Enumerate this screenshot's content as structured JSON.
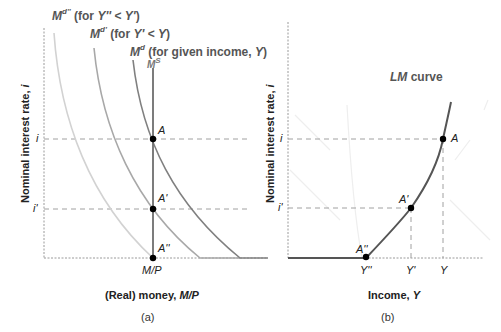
{
  "diagram": {
    "panels": [
      {
        "id": "a",
        "caption": "(a)",
        "x_axis_title": "(Real) money, ",
        "x_axis_title_var": "M/P",
        "y_axis_title": "Nominal interest rate, ",
        "y_axis_title_var": "i",
        "x_tick": "M/P",
        "y_ticks": [
          "i",
          "i'"
        ],
        "curves": [
          {
            "name": "Md''",
            "symbol": "M",
            "sup": "d''",
            "label": " (for ",
            "var1": "Y''",
            "rel": " < ",
            "var2": "Y'",
            "close": ")",
            "color": "#cfcfcf"
          },
          {
            "name": "Md'",
            "symbol": "M",
            "sup": "d'",
            "label": " (for ",
            "var1": "Y'",
            "rel": " < ",
            "var2": "Y",
            "close": ")",
            "color": "#a6a6a6"
          },
          {
            "name": "Md",
            "symbol": "M",
            "sup": "d",
            "label": " (for given income, ",
            "var1": "Y",
            "close": ")",
            "color": "#808080"
          },
          {
            "name": "MS",
            "symbol": "M",
            "sup": "S",
            "color": "#6e6e6e"
          }
        ],
        "points": [
          "A",
          "A'",
          "A''"
        ]
      },
      {
        "id": "b",
        "caption": "(b)",
        "x_axis_title": "Income, ",
        "x_axis_title_var": "Y",
        "y_axis_title": "Nominal interest rate, ",
        "y_axis_title_var": "i",
        "x_ticks": [
          "Y''",
          "Y'",
          "Y"
        ],
        "y_ticks": [
          "i",
          "i'"
        ],
        "curve_label_var": "LM",
        "curve_label": " curve",
        "curve_color": "#555555",
        "points": [
          "A",
          "A'",
          "A''"
        ]
      }
    ]
  }
}
